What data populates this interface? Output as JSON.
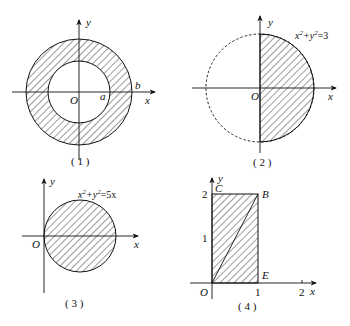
{
  "figures": [
    {
      "id": 1,
      "caption": "( 1 )",
      "description": "Annulus between circles of radius a and b centered at origin",
      "labels": {
        "y_axis": "y",
        "x_axis": "x",
        "origin": "O",
        "inner_radius": "a",
        "outer_radius": "b"
      }
    },
    {
      "id": 2,
      "caption": "( 2 )",
      "description": "Right half of disk x^2+y^2<=3, left half dashed",
      "labels": {
        "y_axis": "y",
        "x_axis": "x",
        "origin": "O",
        "equation_x": "x",
        "equation_sup1": "2",
        "equation_plus": "+y",
        "equation_sup2": "2",
        "equation_rhs": "=3"
      }
    },
    {
      "id": 3,
      "caption": "( 3 )",
      "description": "Disk x^2+y^2<=5x tangent to y-axis at origin",
      "labels": {
        "y_axis": "y",
        "x_axis": "x",
        "origin": "O",
        "equation_x": "x",
        "equation_sup1": "2",
        "equation_plus": "+y",
        "equation_sup2": "2",
        "equation_rhs": "=5x"
      }
    },
    {
      "id": 4,
      "caption": "( 4 )",
      "description": "Rectangle O-E-B-C with diagonal OB, 0<=x<=1, 0<=y<=2",
      "labels": {
        "y_axis": "y",
        "x_axis": "x",
        "origin": "O",
        "point_c": "C",
        "point_b": "B",
        "point_e": "E",
        "tick_y2": "2",
        "tick_y1": "1",
        "tick_x1": "1",
        "tick_x2": "2"
      }
    }
  ],
  "colors": {
    "stroke": "#111111",
    "background": "#ffffff"
  }
}
